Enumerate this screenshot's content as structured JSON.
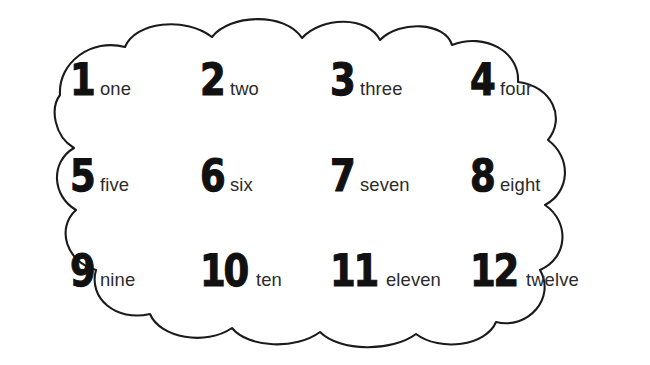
{
  "page": {
    "background_color": "#ffffff",
    "border_color": "#1a1a1a",
    "digit_color": "#111111",
    "word_color": "#2b2b2b",
    "shape": "cloud-outline"
  },
  "items": [
    {
      "digit": "1",
      "word": "one"
    },
    {
      "digit": "2",
      "word": "two"
    },
    {
      "digit": "3",
      "word": "three"
    },
    {
      "digit": "4",
      "word": "four"
    },
    {
      "digit": "5",
      "word": "five"
    },
    {
      "digit": "6",
      "word": "six"
    },
    {
      "digit": "7",
      "word": "seven"
    },
    {
      "digit": "8",
      "word": "eight"
    },
    {
      "digit": "9",
      "word": "nine"
    },
    {
      "digit": "10",
      "word": "ten"
    },
    {
      "digit": "11",
      "word": "eleven"
    },
    {
      "digit": "12",
      "word": "twelve"
    }
  ]
}
